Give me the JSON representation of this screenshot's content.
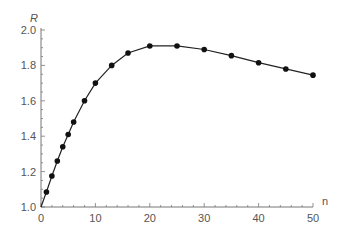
{
  "chart_data": {
    "type": "line",
    "title": "",
    "xlabel": "n",
    "ylabel": "R",
    "xlim": [
      0,
      50
    ],
    "ylim": [
      1.0,
      2.0
    ],
    "x_ticks": [
      "0",
      "10",
      "20",
      "30",
      "40",
      "50"
    ],
    "y_ticks": [
      "1.0",
      "1.2",
      "1.4",
      "1.6",
      "1.8",
      "2.0"
    ],
    "grid": false,
    "legend": "none",
    "series": [
      {
        "name": "R",
        "x": [
          0,
          1,
          2,
          3,
          4,
          5,
          6,
          8,
          10,
          13,
          16,
          20,
          25,
          30,
          35,
          40,
          45,
          50
        ],
        "values": [
          1.0,
          1.085,
          1.175,
          1.26,
          1.34,
          1.41,
          1.48,
          1.6,
          1.7,
          1.8,
          1.87,
          1.91,
          1.91,
          1.89,
          1.855,
          1.815,
          1.78,
          1.745
        ]
      }
    ]
  }
}
